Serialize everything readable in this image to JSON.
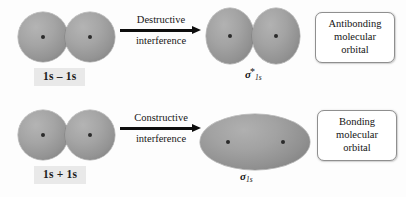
{
  "diagram": {
    "background_color": "#fdfdfd",
    "orbital_color": "#9a9a9a",
    "nucleus_color": "#2b2b2b",
    "arrow_color": "#0d0d0d",
    "label_box_color": "#e9e9e9",
    "callout_border_color": "#8f8f8f"
  },
  "rows": [
    {
      "id": "antibonding-row",
      "reactants": {
        "orbital_a_name": "1s-atomic-orbital",
        "orbital_b_name": "1s-atomic-orbital",
        "combination_label": "1s – 1s"
      },
      "arrow": {
        "text_top": "Destructive",
        "text_bottom": "interference",
        "direction": "right"
      },
      "product": {
        "shape": "two-lobes",
        "sigma_symbol": "σ",
        "sigma_superscript": "*",
        "sigma_subscript": "1s",
        "sigma_full": "σ*1s"
      },
      "callout": {
        "lines": [
          "Antibonding",
          "molecular",
          "orbital"
        ]
      }
    },
    {
      "id": "bonding-row",
      "reactants": {
        "orbital_a_name": "1s-atomic-orbital",
        "orbital_b_name": "1s-atomic-orbital",
        "combination_label": "1s + 1s"
      },
      "arrow": {
        "text_top": "Constructive",
        "text_bottom": "interference",
        "direction": "right"
      },
      "product": {
        "shape": "single-ellipse",
        "sigma_symbol": "σ",
        "sigma_superscript": "",
        "sigma_subscript": "1s",
        "sigma_full": "σ1s"
      },
      "callout": {
        "lines": [
          "Bonding",
          "molecular",
          "orbital"
        ]
      }
    }
  ]
}
